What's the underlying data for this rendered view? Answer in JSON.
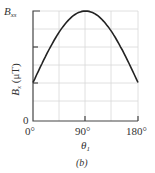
{
  "figure": {
    "caption": "(b)",
    "y_top_label": "B",
    "y_top_label_sub": "xs",
    "y_axis_label": "B",
    "y_axis_label_sub": "x",
    "y_axis_unit": " (μT)",
    "y_zero_label": "0",
    "x_axis_label": "θ",
    "x_axis_label_sub": "1",
    "x_ticks": [
      "0°",
      "90°",
      "180°"
    ]
  },
  "chart_data": {
    "type": "line",
    "title": "",
    "caption": "(b)",
    "xlabel": "θ1",
    "ylabel": "Bx (μT)",
    "x_ticks": [
      "0°",
      "90°",
      "180°"
    ],
    "y_ticks": [
      "0",
      "Bxs"
    ],
    "xlim": [
      0,
      180
    ],
    "ylim_fraction_of_Bxs": [
      0,
      1
    ],
    "grid": true,
    "series": [
      {
        "name": "Bx",
        "x": [
          0,
          22.5,
          45,
          67.5,
          90,
          112.5,
          135,
          157.5,
          180
        ],
        "y_fraction_of_Bxs": [
          0.35,
          0.6,
          0.81,
          0.95,
          1.0,
          0.95,
          0.81,
          0.6,
          0.35
        ]
      }
    ],
    "colors": {
      "curve": "#222222",
      "grid": "#d8d8d8",
      "axis": "#444444"
    }
  }
}
